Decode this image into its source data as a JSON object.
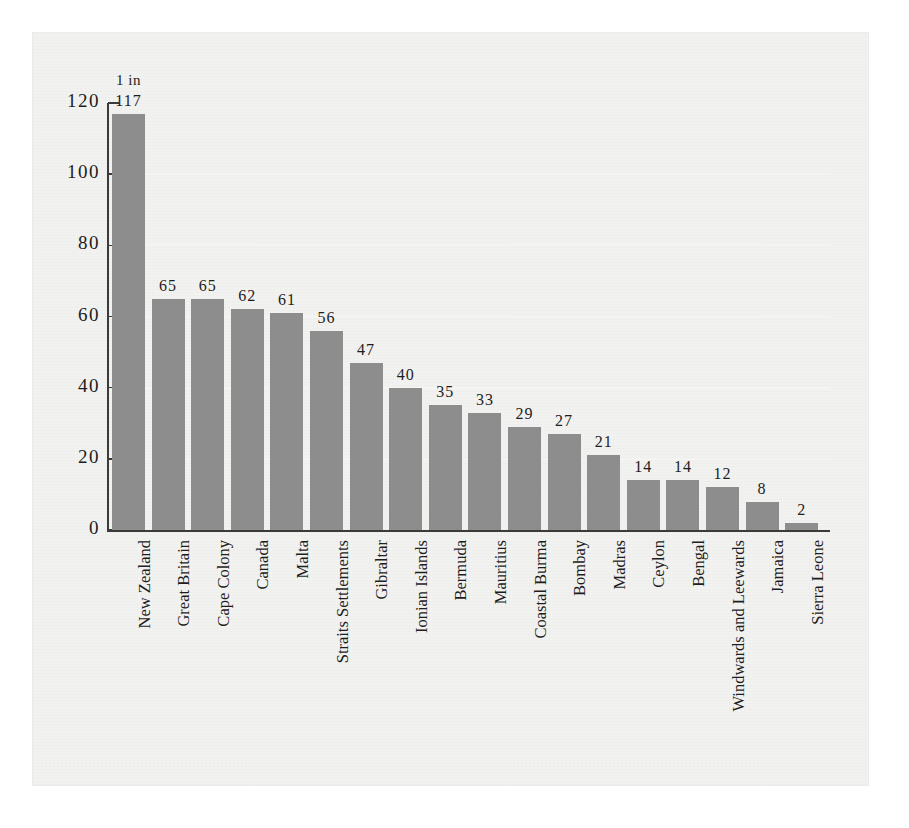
{
  "chart_data": {
    "type": "bar",
    "title": "",
    "subtitle": "",
    "xlabel": "",
    "ylabel": "",
    "unit_annotation": "1 in",
    "ylim": [
      0,
      120
    ],
    "grid": true,
    "gridlines_color": "#f4f4f2",
    "bar_color": "#8d8d8d",
    "legend": "none",
    "axis_color": "#3b3b3b",
    "yticks": [
      0,
      20,
      40,
      60,
      80,
      100,
      120
    ],
    "ytick_labels": [
      "0",
      "20",
      "40",
      "60",
      "80",
      "100",
      "120"
    ],
    "categories": [
      "New Zealand",
      "Great Britain",
      "Cape Colony",
      "Canada",
      "Malta",
      "Straits Settlements",
      "Gibraltar",
      "Ionian Islands",
      "Bermuda",
      "Mauritius",
      "Coastal Burma",
      "Bombay",
      "Madras",
      "Ceylon",
      "Bengal",
      "Windwards and Leewards",
      "Jamaica",
      "Sierra Leone"
    ],
    "values": [
      117,
      65,
      65,
      62,
      61,
      56,
      47,
      40,
      35,
      33,
      29,
      27,
      21,
      14,
      14,
      12,
      8,
      2
    ],
    "value_labels": [
      "117",
      "65",
      "65",
      "62",
      "61",
      "56",
      "47",
      "40",
      "35",
      "33",
      "29",
      "27",
      "21",
      "14",
      "14",
      "12",
      "8",
      "2"
    ]
  },
  "page": {
    "background": "#ffffff",
    "panel_background": "#f2f2f0"
  }
}
